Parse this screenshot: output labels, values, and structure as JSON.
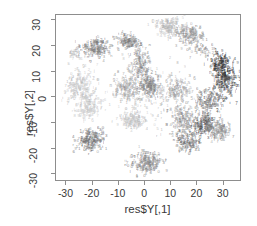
{
  "chart_data": {
    "type": "scatter",
    "title": "",
    "xlabel": "res$Y[,1]",
    "ylabel": "res$Y[,2]",
    "xlim": [
      -34,
      37
    ],
    "ylim": [
      -33,
      32
    ],
    "xticks": [
      "-30",
      "-20",
      "-10",
      "0",
      "10",
      "20",
      "30"
    ],
    "xtick_values": [
      -30,
      -20,
      -10,
      0,
      10,
      20,
      30
    ],
    "yticks": [
      "-30",
      "-20",
      "-10",
      "0",
      "10",
      "20",
      "30"
    ],
    "ytick_values": [
      -30,
      -20,
      -10,
      0,
      10,
      20,
      30
    ],
    "grid": false,
    "legend": null,
    "marker_style": "small-digit-glyph",
    "point_colors": [
      "#9a9a9a",
      "#7d7d7d",
      "#b4b4b4",
      "#5e5e5e",
      "#c8c8c8",
      "#3f3f3f",
      "#262626",
      "#8a8a8a"
    ],
    "axis_color": "#8d8d8d",
    "text_color": "#3a3a3a",
    "background": "#ffffff",
    "n_points_approx": 2600,
    "clusters": [
      {
        "name": "upper-left-mid-grey",
        "cx": -19.0,
        "cy": 19.0,
        "sx": 4.8,
        "sy": 3.2,
        "n": 170,
        "color": "#7d7d7d",
        "size": 4.2
      },
      {
        "name": "upper-left-sparse",
        "cx": -27.0,
        "cy": 16.5,
        "sx": 2.6,
        "sy": 2.0,
        "n": 28,
        "color": "#b0b0b0",
        "size": 4.0
      },
      {
        "name": "left-light-band",
        "cx": -25.0,
        "cy": 4.0,
        "sx": 4.6,
        "sy": 6.0,
        "n": 190,
        "color": "#c2c2c2",
        "size": 4.2
      },
      {
        "name": "left-light-lower",
        "cx": -22.0,
        "cy": -4.0,
        "sx": 4.4,
        "sy": 4.2,
        "n": 150,
        "color": "#c8c8c8",
        "size": 4.2
      },
      {
        "name": "left-dark-lowblob",
        "cx": -21.0,
        "cy": -17.0,
        "sx": 4.4,
        "sy": 3.4,
        "n": 185,
        "color": "#6e6e6e",
        "size": 4.2
      },
      {
        "name": "mid-left-upper",
        "cx": -7.0,
        "cy": 21.5,
        "sx": 3.6,
        "sy": 2.8,
        "n": 120,
        "color": "#828282",
        "size": 4.2
      },
      {
        "name": "mid-upper-col",
        "cx": -2.0,
        "cy": 13.0,
        "sx": 3.0,
        "sy": 5.5,
        "n": 130,
        "color": "#8e8e8e",
        "size": 4.2
      },
      {
        "name": "center-grey-core",
        "cx": 1.0,
        "cy": 4.0,
        "sx": 4.0,
        "sy": 4.0,
        "n": 185,
        "color": "#808080",
        "size": 4.2
      },
      {
        "name": "center-left-mid",
        "cx": -8.0,
        "cy": 3.0,
        "sx": 3.6,
        "sy": 4.4,
        "n": 130,
        "color": "#9c9c9c",
        "size": 4.2
      },
      {
        "name": "center-light-lower",
        "cx": -5.0,
        "cy": -9.0,
        "sx": 4.6,
        "sy": 3.4,
        "n": 150,
        "color": "#c4c4c4",
        "size": 4.2
      },
      {
        "name": "bottom-center-blob",
        "cx": 0.0,
        "cy": -26.0,
        "sx": 5.0,
        "sy": 3.6,
        "n": 200,
        "color": "#858585",
        "size": 4.2
      },
      {
        "name": "top-center-light",
        "cx": 9.0,
        "cy": 27.0,
        "sx": 5.2,
        "sy": 3.0,
        "n": 165,
        "color": "#b8b8b8",
        "size": 4.2
      },
      {
        "name": "top-right-grey",
        "cx": 17.0,
        "cy": 24.0,
        "sx": 4.4,
        "sy": 3.2,
        "n": 150,
        "color": "#999999",
        "size": 4.2
      },
      {
        "name": "upper-right-sparse",
        "cx": 22.0,
        "cy": 18.0,
        "sx": 5.0,
        "sy": 2.6,
        "n": 45,
        "color": "#8a8a8a",
        "size": 4.0
      },
      {
        "name": "right-dark-edge",
        "cx": 30.0,
        "cy": 6.0,
        "sx": 3.6,
        "sy": 6.5,
        "n": 200,
        "color": "#3a3a3a",
        "size": 4.4
      },
      {
        "name": "right-dark-upper",
        "cx": 28.0,
        "cy": 13.0,
        "sx": 3.0,
        "sy": 3.0,
        "n": 95,
        "color": "#2e2e2e",
        "size": 4.4
      },
      {
        "name": "right-mid-grey",
        "cx": 24.0,
        "cy": -2.0,
        "sx": 4.2,
        "sy": 4.0,
        "n": 130,
        "color": "#777777",
        "size": 4.2
      },
      {
        "name": "right-lower-dark",
        "cx": 22.0,
        "cy": -11.0,
        "sx": 5.0,
        "sy": 4.0,
        "n": 185,
        "color": "#5a5a5a",
        "size": 4.2
      },
      {
        "name": "right-lower-grey2",
        "cx": 28.0,
        "cy": -13.0,
        "sx": 3.6,
        "sy": 3.4,
        "n": 110,
        "color": "#8c8c8c",
        "size": 4.2
      },
      {
        "name": "mid-right-lower",
        "cx": 14.0,
        "cy": -9.0,
        "sx": 4.2,
        "sy": 4.6,
        "n": 150,
        "color": "#909090",
        "size": 4.2
      },
      {
        "name": "mid-right-low2",
        "cx": 16.0,
        "cy": -18.0,
        "sx": 4.4,
        "sy": 3.4,
        "n": 120,
        "color": "#6a6a6a",
        "size": 4.2
      },
      {
        "name": "center-right-mid",
        "cx": 12.0,
        "cy": 2.0,
        "sx": 4.0,
        "sy": 4.6,
        "n": 140,
        "color": "#a2a2a2",
        "size": 4.2
      },
      {
        "name": "scatter-haze",
        "cx": 2.0,
        "cy": 0.0,
        "sx": 15.0,
        "sy": 13.0,
        "n": 150,
        "color": "#b6b6b6",
        "size": 3.8
      }
    ]
  }
}
